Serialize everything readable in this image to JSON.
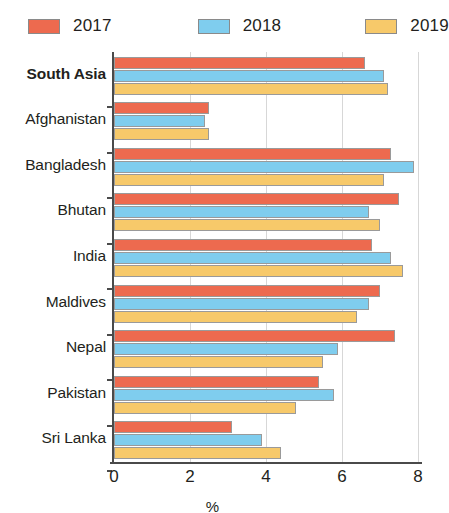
{
  "legend": {
    "items": [
      {
        "label": "2017",
        "color": "#ed6a4f"
      },
      {
        "label": "2018",
        "color": "#7fcdee"
      },
      {
        "label": "2019",
        "color": "#f7c96a"
      }
    ]
  },
  "axis": {
    "x_title": "%",
    "ticks": [
      "0",
      "2",
      "4",
      "6",
      "8"
    ]
  },
  "chart_data": {
    "type": "bar",
    "orientation": "horizontal",
    "title": "",
    "subtitle": "",
    "xlabel": "%",
    "ylabel": "",
    "xlim": [
      0,
      8
    ],
    "xticks": [
      0,
      2,
      4,
      6,
      8
    ],
    "grid": true,
    "legend_position": "top-left",
    "categories": [
      "South Asia",
      "Afghanistan",
      "Bangladesh",
      "Bhutan",
      "India",
      "Maldives",
      "Nepal",
      "Pakistan",
      "Sri Lanka"
    ],
    "highlighted_categories": [
      "South Asia"
    ],
    "series": [
      {
        "name": "2017",
        "color": "#ed6a4f",
        "values": [
          6.6,
          2.5,
          7.3,
          7.5,
          6.8,
          7.0,
          7.4,
          5.4,
          3.1
        ]
      },
      {
        "name": "2018",
        "color": "#7fcdee",
        "values": [
          7.1,
          2.4,
          7.9,
          6.7,
          7.3,
          6.7,
          5.9,
          5.8,
          3.9
        ]
      },
      {
        "name": "2019",
        "color": "#f7c96a",
        "values": [
          7.2,
          2.5,
          7.1,
          7.0,
          7.6,
          6.4,
          5.5,
          4.8,
          4.4
        ]
      }
    ]
  }
}
